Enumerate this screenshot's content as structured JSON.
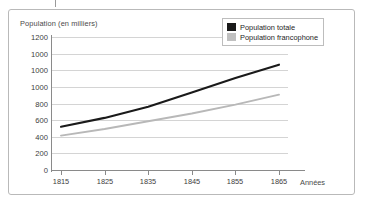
{
  "frame": {
    "border_color": "#b9b9b9"
  },
  "chart_data": {
    "type": "line",
    "title": "",
    "subtitle": "",
    "ylabel": "Population (en milliers)",
    "xlabel": "Années",
    "grid": true,
    "legend_position": "top-right",
    "xlim": [
      1810,
      1870
    ],
    "ylim": [
      0,
      1200
    ],
    "ytick_labels": [
      "1200",
      "1000",
      "1000",
      "1000",
      "800",
      "600",
      "400",
      "200",
      "0"
    ],
    "ytick_values": [
      1200,
      1050,
      900,
      750,
      800,
      600,
      400,
      200,
      0
    ],
    "xtick_labels": [
      "1815",
      "1825",
      "1835",
      "1845",
      "1855",
      "1865"
    ],
    "x": [
      1815,
      1825,
      1835,
      1845,
      1855,
      1865
    ],
    "series": [
      {
        "name": "Population totale",
        "color": "#1a1a1a",
        "values": [
          390,
          470,
          570,
          700,
          830,
          950
        ]
      },
      {
        "name": "Population francophone",
        "color": "#b8b8b8",
        "values": [
          310,
          370,
          440,
          510,
          590,
          680
        ]
      }
    ]
  },
  "legend": {
    "items": [
      {
        "label": "Population totale",
        "color": "#1a1a1a"
      },
      {
        "label": "Population francophone",
        "color": "#c0c0c0"
      }
    ]
  }
}
